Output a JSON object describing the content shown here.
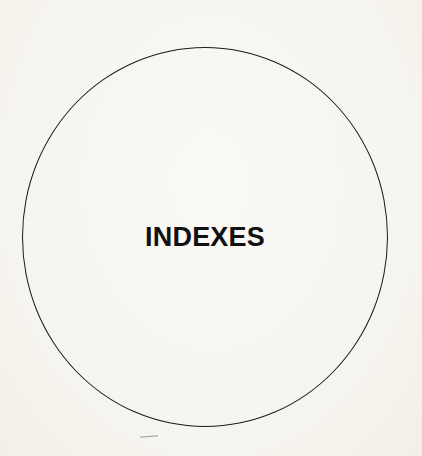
{
  "page": {
    "heading": "INDEXES",
    "background_color": "#f7f5ef",
    "circle_stroke_color": "#1a1a1a",
    "text_color": "#111111"
  }
}
